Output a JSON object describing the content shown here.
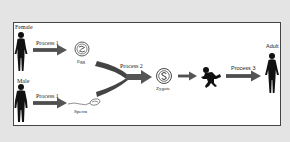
{
  "diagram": {
    "title": "",
    "nodes": {
      "female": {
        "label": "Female",
        "icon": "female-silhouette-icon"
      },
      "male": {
        "label": "Male",
        "icon": "male-silhouette-icon"
      },
      "egg": {
        "label": "Egg",
        "icon": "egg-cell-icon"
      },
      "sperm": {
        "label": "Sperm",
        "icon": "sperm-cell-icon"
      },
      "zygote": {
        "label": "Zygote",
        "icon": "zygote-cell-icon"
      },
      "baby": {
        "label": "",
        "icon": "baby-silhouette-icon"
      },
      "adult": {
        "label": "Adult",
        "icon": "adult-silhouette-icon"
      }
    },
    "edges": [
      {
        "from": "female",
        "to": "egg",
        "label": "Process 1"
      },
      {
        "from": "male",
        "to": "sperm",
        "label": "Process 1"
      },
      {
        "from": "egg+sperm",
        "to": "zygote",
        "label": "Process 2"
      },
      {
        "from": "zygote",
        "to": "baby",
        "label": ""
      },
      {
        "from": "baby",
        "to": "adult",
        "label": "Process 3"
      }
    ],
    "colors": {
      "background": "#e4e4e4",
      "panel": "#ffffff",
      "arrow": "#555555",
      "silhouette": "#111111",
      "border": "#444444"
    }
  }
}
